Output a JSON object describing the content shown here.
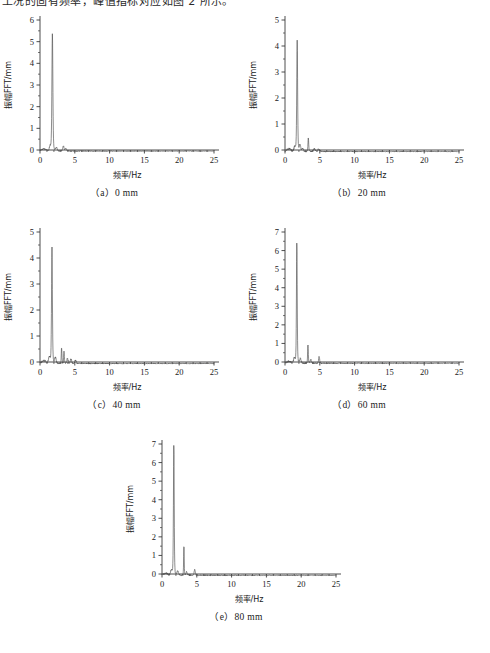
{
  "page": {
    "top_text_fragment": "工况的固有频率，峰值指标对应如图 2 所示。",
    "background_color": "#ffffff",
    "trace_color": "#4d4d4d",
    "axis_color": "#3a3a3a"
  },
  "figure": {
    "panels": [
      {
        "id": "a",
        "caption": "（a）0 mm"
      },
      {
        "id": "b",
        "caption": "（b）20 mm"
      },
      {
        "id": "c",
        "caption": "（c）40 mm"
      },
      {
        "id": "d",
        "caption": "（d）60 mm"
      },
      {
        "id": "e",
        "caption": "（e）80 mm"
      }
    ]
  },
  "chart_data": [
    {
      "id": "a",
      "type": "line",
      "title": "（a）0 mm",
      "xlabel": "频率/Hz",
      "ylabel": "振幅FFT/mm",
      "xlim": [
        0,
        25
      ],
      "ylim": [
        0,
        6
      ],
      "xticks": [
        0,
        5,
        10,
        15,
        20,
        25
      ],
      "yticks": [
        0,
        1,
        2,
        3,
        4,
        5,
        6
      ],
      "xminor_step": 1,
      "yminor_step": 0.5,
      "grid": false,
      "legend": false,
      "peaks": [
        {
          "freq": 1.78,
          "amp": 5.42,
          "width": 0.1
        },
        {
          "freq": 1.45,
          "amp": 0.22,
          "width": 0.16
        },
        {
          "freq": 2.35,
          "amp": 0.17,
          "width": 0.18
        },
        {
          "freq": 3.35,
          "amp": 0.24,
          "width": 0.14
        },
        {
          "freq": 3.7,
          "amp": 0.12,
          "width": 0.14
        }
      ],
      "baseline": -0.05,
      "noise_amp": 0.022
    },
    {
      "id": "b",
      "type": "line",
      "title": "（b）20 mm",
      "xlabel": "频率/Hz",
      "ylabel": "振幅FFT/mm",
      "xlim": [
        0,
        25
      ],
      "ylim": [
        0,
        5
      ],
      "xticks": [
        0,
        5,
        10,
        15,
        20,
        25
      ],
      "yticks": [
        0,
        1,
        2,
        3,
        4,
        5
      ],
      "xminor_step": 1,
      "yminor_step": 0.5,
      "grid": false,
      "legend": false,
      "peaks": [
        {
          "freq": 1.75,
          "amp": 4.25,
          "width": 0.09
        },
        {
          "freq": 1.4,
          "amp": 0.2,
          "width": 0.16
        },
        {
          "freq": 2.15,
          "amp": 0.26,
          "width": 0.16
        },
        {
          "freq": 2.55,
          "amp": 0.12,
          "width": 0.14
        },
        {
          "freq": 3.35,
          "amp": 0.52,
          "width": 0.08
        },
        {
          "freq": 4.2,
          "amp": 0.11,
          "width": 0.16
        },
        {
          "freq": 4.85,
          "amp": 0.1,
          "width": 0.16
        }
      ],
      "baseline": -0.06,
      "noise_amp": 0.025
    },
    {
      "id": "c",
      "type": "line",
      "title": "（c）40 mm",
      "xlabel": "频率/Hz",
      "ylabel": "振幅FFT/mm",
      "xlim": [
        0,
        25
      ],
      "ylim": [
        0,
        5
      ],
      "xticks": [
        0,
        5,
        10,
        15,
        20,
        25
      ],
      "yticks": [
        0,
        1,
        2,
        3,
        4,
        5
      ],
      "xminor_step": 1,
      "yminor_step": 0.5,
      "grid": false,
      "legend": false,
      "peaks": [
        {
          "freq": 1.72,
          "amp": 4.45,
          "width": 0.09
        },
        {
          "freq": 1.35,
          "amp": 0.26,
          "width": 0.17
        },
        {
          "freq": 2.2,
          "amp": 0.24,
          "width": 0.16
        },
        {
          "freq": 3.1,
          "amp": 0.6,
          "width": 0.07
        },
        {
          "freq": 3.45,
          "amp": 0.5,
          "width": 0.07
        },
        {
          "freq": 3.95,
          "amp": 0.2,
          "width": 0.12
        },
        {
          "freq": 4.45,
          "amp": 0.17,
          "width": 0.14
        },
        {
          "freq": 5.1,
          "amp": 0.12,
          "width": 0.16
        }
      ],
      "baseline": -0.06,
      "noise_amp": 0.028
    },
    {
      "id": "d",
      "type": "line",
      "title": "（d）60 mm",
      "xlabel": "频率/Hz",
      "ylabel": "振幅FFT/mm",
      "xlim": [
        0,
        25
      ],
      "ylim": [
        0,
        7
      ],
      "xticks": [
        0,
        5,
        10,
        15,
        20,
        25
      ],
      "yticks": [
        0,
        1,
        2,
        3,
        4,
        5,
        6,
        7
      ],
      "xminor_step": 1,
      "yminor_step": 0.5,
      "grid": false,
      "legend": false,
      "peaks": [
        {
          "freq": 1.7,
          "amp": 6.5,
          "width": 0.08
        },
        {
          "freq": 1.35,
          "amp": 0.3,
          "width": 0.16
        },
        {
          "freq": 2.2,
          "amp": 0.26,
          "width": 0.16
        },
        {
          "freq": 3.3,
          "amp": 1.0,
          "width": 0.07
        },
        {
          "freq": 3.7,
          "amp": 0.2,
          "width": 0.13
        },
        {
          "freq": 4.9,
          "amp": 0.35,
          "width": 0.11
        }
      ],
      "baseline": -0.07,
      "noise_amp": 0.03
    },
    {
      "id": "e",
      "type": "line",
      "title": "（e）80 mm",
      "xlabel": "频率/Hz",
      "ylabel": "振幅FFT/mm",
      "xlim": [
        0,
        25
      ],
      "ylim": [
        0,
        7
      ],
      "xticks": [
        0,
        5,
        10,
        15,
        20,
        25
      ],
      "yticks": [
        0,
        1,
        2,
        3,
        4,
        5,
        6,
        7
      ],
      "xminor_step": 1,
      "yminor_step": 0.5,
      "grid": false,
      "legend": false,
      "peaks": [
        {
          "freq": 1.7,
          "amp": 7.0,
          "width": 0.08
        },
        {
          "freq": 1.35,
          "amp": 0.3,
          "width": 0.16
        },
        {
          "freq": 2.25,
          "amp": 0.24,
          "width": 0.17
        },
        {
          "freq": 3.15,
          "amp": 1.6,
          "width": 0.06
        },
        {
          "freq": 3.55,
          "amp": 0.18,
          "width": 0.13
        },
        {
          "freq": 4.7,
          "amp": 0.3,
          "width": 0.12
        }
      ],
      "baseline": -0.07,
      "noise_amp": 0.03
    }
  ]
}
